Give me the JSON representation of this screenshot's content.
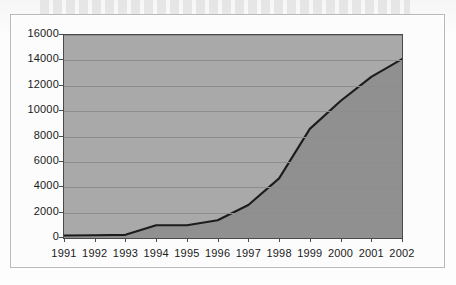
{
  "chart_data": {
    "type": "area",
    "title": "",
    "subtitle": "",
    "xlabel": "",
    "ylabel": "",
    "categories": [
      "1991",
      "1992",
      "1993",
      "1994",
      "1995",
      "1996",
      "1997",
      "1998",
      "1999",
      "2000",
      "2001",
      "2002"
    ],
    "values": [
      200,
      220,
      250,
      1000,
      1000,
      1400,
      2600,
      4700,
      8600,
      10800,
      12700,
      14100
    ],
    "series": [
      {
        "name": "",
        "values": [
          200,
          220,
          250,
          1000,
          1000,
          1400,
          2600,
          4700,
          8600,
          10800,
          12700,
          14100
        ]
      }
    ],
    "ylim": [
      0,
      16000
    ],
    "ytick_values": [
      0,
      2000,
      4000,
      6000,
      8000,
      10000,
      12000,
      14000,
      16000
    ],
    "ytick_labels": [
      "0",
      "2000",
      "4000",
      "6000",
      "8000",
      "10000",
      "12000",
      "14000",
      "16000"
    ],
    "xtick_labels": [
      "1991",
      "1992",
      "1993",
      "1994",
      "1995",
      "1996",
      "1997",
      "1998",
      "1999",
      "2000",
      "2001",
      "2002"
    ],
    "grid": true,
    "legend": false,
    "legend_position": "none",
    "colors": {
      "plot_background": "#a9a9a9",
      "area_fill": "#909090",
      "line": "#1c1c1c",
      "gridline": "#8d8d8d",
      "axis": "#4a4a4a",
      "text": "#1a1a1a",
      "page_background": "#fdfdfd",
      "frame_border": "#b9b9b9"
    }
  }
}
